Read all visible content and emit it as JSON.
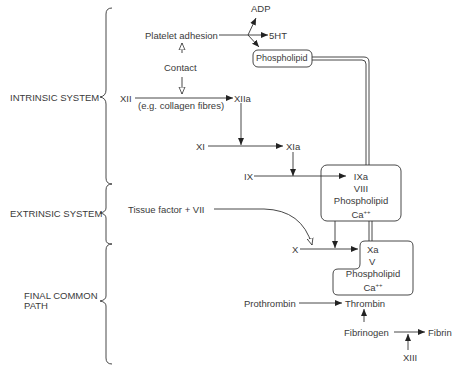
{
  "systems": {
    "intrinsic": "INTRINSIC SYSTEM",
    "extrinsic": "EXTRINSIC SYSTEM",
    "final_common_1": "FINAL COMMON",
    "final_common_2": "PATH"
  },
  "nodes": {
    "adp": "ADP",
    "platelet_adhesion": "Platelet adhesion",
    "five_ht": "5HT",
    "phospholipid_top": "Phospholipid",
    "contact": "Contact",
    "xii": "XII",
    "collagen_note": "(e.g. collagen fibres)",
    "xiia": "XIIa",
    "xi": "XI",
    "xia": "XIa",
    "ix": "IX",
    "tissue_factor": "Tissue factor + VII",
    "x": "X",
    "prothrombin": "Prothrombin",
    "thrombin": "Thrombin",
    "fibrinogen": "Fibrinogen",
    "fibrin": "Fibrin",
    "xiii": "XIII"
  },
  "complex_ix": {
    "line1": "IXa",
    "line2": "VIII",
    "line3": "Phospholipid",
    "line4_base": "Ca",
    "line4_sup": "++"
  },
  "complex_x": {
    "line1": "Xa",
    "line2": "V",
    "line3": "Phospholipid",
    "line4_base": "Ca",
    "line4_sup": "++"
  }
}
